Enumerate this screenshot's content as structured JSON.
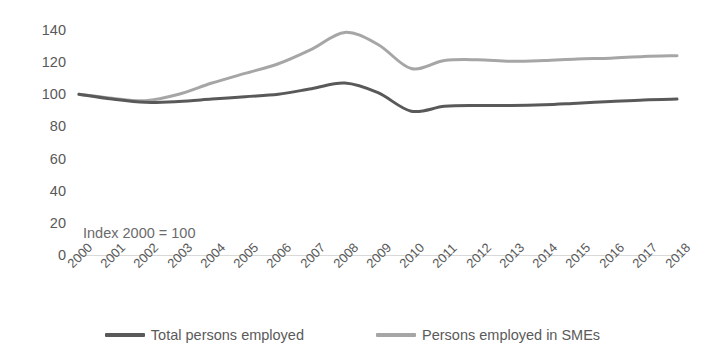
{
  "chart_data": {
    "type": "line",
    "title": "",
    "subtitle": "",
    "annotation": "Index 2000 = 100",
    "xlabel": "",
    "ylabel": "",
    "ylim": [
      0,
      140
    ],
    "y_ticks": [
      140,
      120,
      100,
      80,
      60,
      40,
      20,
      0
    ],
    "grid": false,
    "legend_position": "bottom-center",
    "categories": [
      "2000",
      "2001",
      "2002",
      "2003",
      "2004",
      "2005",
      "2006",
      "2007",
      "2008",
      "2009",
      "2010",
      "2011",
      "2012",
      "2013",
      "2014",
      "2015",
      "2016",
      "2017",
      "2018"
    ],
    "series": [
      {
        "name": "Total persons employed",
        "color": "#595959",
        "values": [
          100,
          97,
          95,
          95.5,
          97,
          98.5,
          100,
          103.5,
          107,
          101,
          89.5,
          92.5,
          93,
          93,
          93.5,
          94.5,
          95.5,
          96.5,
          97
        ]
      },
      {
        "name": "Persons employed in SMEs",
        "color": "#a6a6a6",
        "values": [
          100,
          97.5,
          96,
          100,
          107,
          113,
          119,
          128,
          138.5,
          131,
          116,
          121,
          121.5,
          120.5,
          121,
          122,
          122.5,
          123.5,
          124
        ]
      }
    ]
  },
  "legend": {
    "items": [
      {
        "label": "Total persons employed",
        "color": "#595959"
      },
      {
        "label": "Persons employed in SMEs",
        "color": "#a6a6a6"
      }
    ]
  }
}
